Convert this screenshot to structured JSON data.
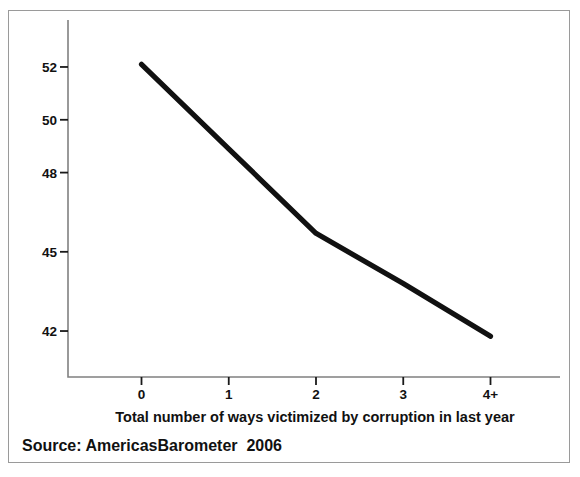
{
  "figure": {
    "background_color": "#ffffff",
    "frame_color": "#9a9a9a",
    "y_axis_title": "System Support",
    "x_axis_title": "Total number of ways victimized by corruption in last year",
    "source_note": "Source: AmericasBarometer  2006"
  },
  "chart_data": {
    "type": "line",
    "title": "",
    "subtitle": "",
    "xlabel": "Total number of ways victimized by corruption in last year",
    "ylabel": "System Support",
    "categories": [
      "0",
      "1",
      "2",
      "3",
      "4+"
    ],
    "x": [
      0,
      1,
      2,
      3,
      4
    ],
    "values": [
      52.1,
      48.9,
      45.7,
      43.8,
      41.8
    ],
    "series": [
      {
        "name": "System Support",
        "values": [
          52.1,
          48.9,
          45.7,
          43.8,
          41.8
        ],
        "color": "#111111",
        "line_width": 5.2
      }
    ],
    "x_tick_labels": [
      "0",
      "1",
      "2",
      "3",
      "4+"
    ],
    "y_tick_labels": [
      "52",
      "50",
      "48",
      "45",
      "42"
    ],
    "y_tick_values": [
      52,
      50,
      48,
      45,
      42
    ],
    "ylim": [
      40.6,
      53.4
    ],
    "xlim": [
      -0.55,
      4.55
    ],
    "grid": false,
    "legend": false,
    "legend_position": "none",
    "annotations": []
  }
}
